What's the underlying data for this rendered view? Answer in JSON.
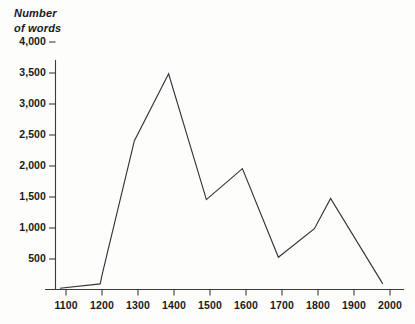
{
  "chart_data": {
    "type": "line",
    "title": "",
    "ylabel": "Number\nof words",
    "xlabel": "",
    "xlim": [
      1050,
      2050
    ],
    "ylim": [
      0,
      4150
    ],
    "grid": false,
    "legend": null,
    "y_ticks": [
      "4,000",
      "3,500",
      "3,000",
      "2,500",
      "2,000",
      "1,500",
      "1,000",
      "500"
    ],
    "y_tick_values": [
      4000,
      3500,
      3000,
      2500,
      2000,
      1500,
      1000,
      500
    ],
    "x_ticks": [
      "1100",
      "1200",
      "1300",
      "1400",
      "1500",
      "1600",
      "1700",
      "1800",
      "1900",
      "2000"
    ],
    "x_tick_values": [
      1100,
      1200,
      1300,
      1400,
      1500,
      1600,
      1700,
      1800,
      1900,
      2000
    ],
    "series": [
      {
        "name": "Number of words",
        "color": "#35333a",
        "x": [
          1083,
          1195,
          1200,
          1290,
          1385,
          1490,
          1590,
          1690,
          1790,
          1835,
          1980
        ],
        "values": [
          20,
          90,
          230,
          2400,
          3480,
          1450,
          1950,
          520,
          980,
          1470,
          90
        ]
      }
    ]
  },
  "axes": {
    "y_axis_color": "#3b3b3b",
    "x_axis_color": "#3b3b3b"
  },
  "canvas": {
    "background": "#fdfdfb"
  }
}
